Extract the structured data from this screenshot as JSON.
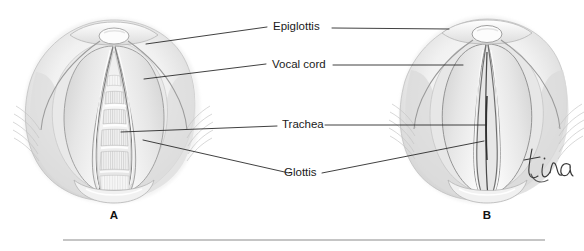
{
  "figure": {
    "style": "grayscale pencil medical illustration",
    "background_color": "#ffffff",
    "ink_color": "#2b2b2b",
    "rule_color": "#8c8c8c"
  },
  "labels": {
    "epiglottis": "Epiglottis",
    "vocal_cord": "Vocal cord",
    "trachea": "Trachea",
    "glottis": "Glottis"
  },
  "panels": [
    {
      "id": "A",
      "letter": "A",
      "description": "Glottis open — vocal cords abducted, tracheal rings visible"
    },
    {
      "id": "B",
      "letter": "B",
      "description": "Glottis closed — vocal cords adducted"
    }
  ],
  "signature": {
    "text": "tina",
    "color": "#3a3a3a"
  }
}
